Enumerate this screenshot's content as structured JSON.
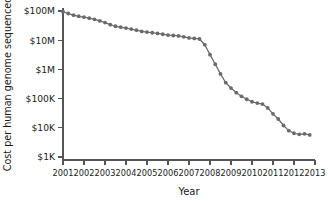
{
  "chart_data": {
    "type": "line",
    "title": "",
    "xlabel": "Year",
    "ylabel": "Cost per human genome sequenced",
    "yscale": "log",
    "xlim": [
      2001,
      2013
    ],
    "ylim": [
      1000,
      100000000
    ],
    "grid": false,
    "legend": null,
    "ytick_labels": [
      "$100M",
      "$10M",
      "$1M",
      "$100K",
      "$10K",
      "$1K"
    ],
    "ytick_values": [
      100000000,
      10000000,
      1000000,
      100000,
      10000,
      1000
    ],
    "xtick_labels": [
      "2001",
      "2002",
      "2003",
      "2004",
      "2005",
      "2006",
      "2007",
      "2008",
      "2009",
      "2010",
      "2011",
      "2012",
      "2013"
    ],
    "xtick_values": [
      2001,
      2002,
      2003,
      2004,
      2005,
      2006,
      2007,
      2008,
      2009,
      2010,
      2011,
      2012,
      2013
    ],
    "series": [
      {
        "name": "Cost per human genome sequenced",
        "color": "#6a6a6a",
        "marker": "circle",
        "x": [
          2001.0,
          2001.25,
          2001.5,
          2001.75,
          2002.0,
          2002.25,
          2002.5,
          2002.75,
          2003.0,
          2003.25,
          2003.5,
          2003.75,
          2004.0,
          2004.25,
          2004.5,
          2004.75,
          2005.0,
          2005.25,
          2005.5,
          2005.75,
          2006.0,
          2006.25,
          2006.5,
          2006.75,
          2007.0,
          2007.25,
          2007.5,
          2007.75,
          2008.0,
          2008.25,
          2008.5,
          2008.75,
          2009.0,
          2009.25,
          2009.5,
          2009.75,
          2010.0,
          2010.25,
          2010.5,
          2010.75,
          2011.0,
          2011.25,
          2011.5,
          2011.75,
          2012.0,
          2012.25,
          2012.5,
          2012.75
        ],
        "y": [
          95000000,
          82000000,
          72000000,
          66000000,
          62000000,
          57000000,
          52000000,
          46000000,
          40000000,
          34000000,
          30000000,
          28000000,
          26000000,
          24000000,
          22000000,
          20000000,
          19000000,
          18000000,
          17000000,
          16000000,
          15000000,
          14500000,
          14000000,
          13000000,
          12000000,
          11500000,
          11000000,
          7000000,
          3200000,
          1500000,
          700000,
          350000,
          230000,
          160000,
          120000,
          95000,
          78000,
          70000,
          65000,
          48000,
          30000,
          20000,
          12000,
          8000,
          6500,
          6000,
          6200,
          5700
        ]
      }
    ]
  }
}
